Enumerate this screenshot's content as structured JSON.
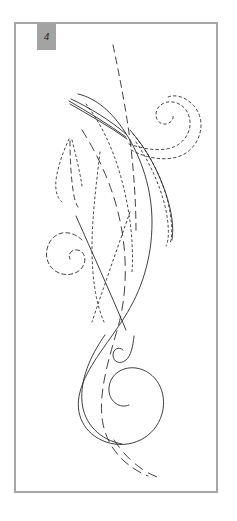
{
  "panel": {
    "label": "4",
    "label_style": "italic",
    "label_background": "#a3a3a3",
    "label_text_color": "#1c1c1c",
    "frame_border_color": "#a6a6a6",
    "frame_background": "#ffffff",
    "page_background": "#ffffff"
  },
  "artwork": {
    "title": "Abstract calligraphic line drawing",
    "description": "Flowing swash curves, tendrils and spirals converging near a single point in the upper area, rendered in solid, dashed and dotted black strokes on a white field.",
    "ink_color": "#2b2b2b",
    "stroke_width": "0.9",
    "strokes": [
      {
        "id": "main-swash",
        "name": "main-solid-swash",
        "style": "solid",
        "dash": "none",
        "d": "M 78 94 C 96 98 112 112 125 132 C 142 158 152 190 152 222 C 152 258 142 290 124 318 C 106 346 86 368 80 392 C 74 414 84 434 106 442 C 130 450 155 438 162 414 C 168 392 156 371 136 368 C 120 366 108 377 109 391 C 110 402 120 409 129 405"
      },
      {
        "id": "tall-dashed-stem",
        "name": "tall-dashed-vertical-stem",
        "style": "dashed",
        "dash": "7 5",
        "d": "M 113 45 C 120 78 126 110 130 140 C 134 172 136 204 136 232"
      },
      {
        "id": "dashed-long-sweep",
        "name": "long-dashed-sweep",
        "style": "dashed",
        "dash": "9 6",
        "d": "M 82 130 C 96 152 110 180 118 212 C 128 252 128 296 116 334 C 106 368 98 398 103 424 C 108 448 124 466 148 476"
      },
      {
        "id": "dotted-inner-curve",
        "name": "dotted-inner-curve",
        "style": "dotted",
        "dash": "2 3",
        "d": "M 86 104 C 100 122 112 146 120 174 C 130 208 134 244 132 272"
      },
      {
        "id": "dotted-left-descender",
        "name": "dotted-left-descender",
        "style": "dotted",
        "dash": "2 3",
        "d": "M 100 152 C 96 186 92 218 92 248 C 92 278 96 304 104 322"
      },
      {
        "id": "right-solid-tendril",
        "name": "right-solid-tendril",
        "style": "solid",
        "dash": "none",
        "d": "M 130 130 C 146 148 158 170 166 194 C 172 212 174 228 172 240"
      },
      {
        "id": "right-dotted-tendril",
        "name": "right-dotted-tendril",
        "style": "dotted",
        "dash": "2 3",
        "d": "M 133 134 C 150 154 162 178 168 202 C 172 220 173 234 170 244"
      },
      {
        "id": "right-dotted-outer",
        "name": "right-dotted-outer-tendril",
        "style": "dotted",
        "dash": "2 3",
        "d": "M 136 142 C 152 166 163 192 167 216 C 169 230 169 240 166 246"
      },
      {
        "id": "upper-right-spiral",
        "name": "upper-right-dotted-spiral",
        "style": "dotted",
        "dash": "2.5 3",
        "d": "M 129 144 C 146 150 164 152 176 146 C 190 138 194 122 186 110 C 179 100 164 99 158 108 C 153 116 158 125 166 124 C 171 123 174 119 173 115"
      },
      {
        "id": "upper-right-spiral-outer",
        "name": "upper-right-dotted-spiral-outer",
        "style": "dotted",
        "dash": "2.5 3",
        "d": "M 131 150 C 150 160 172 162 186 153 C 202 142 206 120 194 106 C 186 97 176 94 168 97"
      },
      {
        "id": "left-dashed-spiral",
        "name": "left-dashed-spiral",
        "style": "dashed",
        "dash": "4 3",
        "d": "M 82 240 C 74 232 62 230 54 237 C 44 246 44 262 54 270 C 64 278 80 275 84 264 C 87 256 82 249 75 250 C 70 251 68 255 70 259"
      },
      {
        "id": "lower-small-hook",
        "name": "lower-small-hook-spiral",
        "style": "solid",
        "dash": "none",
        "d": "M 134 336 C 133 346 131 356 126 360 C 120 365 113 362 113 355 C 113 349 119 346 123 350"
      },
      {
        "id": "left-feather-a",
        "name": "left-feather-dotted-a",
        "style": "dotted",
        "dash": "2 3",
        "d": "M 69 139 C 63 152 58 166 56 180 C 55 190 57 198 62 202"
      },
      {
        "id": "left-feather-b",
        "name": "left-feather-dashed-b",
        "style": "dashed",
        "dash": "5 4",
        "d": "M 70 141 C 70 158 71 176 73 190 C 74 198 76 204 78 207"
      },
      {
        "id": "left-feather-c",
        "name": "left-feather-dotted-c",
        "style": "dotted",
        "dash": "2 3",
        "d": "M 72 140 C 76 156 80 172 82 186"
      },
      {
        "id": "convergence-fan-a",
        "name": "convergence-fan-stroke-a",
        "style": "solid",
        "dash": "none",
        "d": "M 71 99 C 90 108 110 120 126 134"
      },
      {
        "id": "convergence-fan-b",
        "name": "convergence-fan-stroke-b",
        "style": "solid",
        "dash": "none",
        "d": "M 69 101 C 88 112 108 124 126 137"
      },
      {
        "id": "convergence-fan-c",
        "name": "convergence-fan-stroke-c",
        "style": "solid",
        "dash": "none",
        "d": "M 70 104 C 89 115 109 126 127 139"
      },
      {
        "id": "diagonal-crossing-a",
        "name": "diagonal-crossing-stroke-a",
        "style": "solid",
        "dash": "none",
        "d": "M 76 216 C 92 252 110 292 126 330"
      },
      {
        "id": "diagonal-crossing-b",
        "name": "diagonal-crossing-stroke-b",
        "style": "dotted",
        "dash": "2 3",
        "d": "M 130 212 C 116 252 102 292 92 322"
      },
      {
        "id": "bottom-dashed-tail",
        "name": "bottom-dashed-tail",
        "style": "dashed",
        "dash": "9 7",
        "d": "M 114 440 C 126 458 142 472 160 478"
      },
      {
        "id": "lower-left-bowl",
        "name": "lower-left-solid-bowl",
        "style": "solid",
        "dash": "none",
        "d": "M 105 335 C 90 356 80 380 82 402 C 84 424 100 440 122 444"
      }
    ]
  }
}
